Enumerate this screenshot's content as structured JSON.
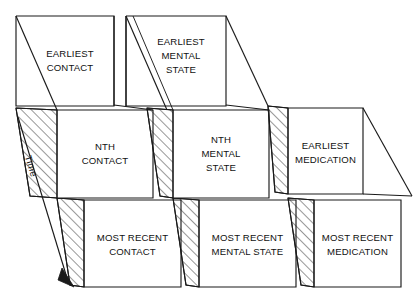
{
  "diagram": {
    "axis": {
      "label": "Time",
      "direction": "down-left",
      "arrow": "arrow-head-down-left"
    },
    "colors": {
      "stroke": "#1a1a1a",
      "fill": "#ffffff",
      "hatch": "#1a1a1a"
    },
    "columns": [
      {
        "id": "contact",
        "name": "Contact"
      },
      {
        "id": "mental-state",
        "name": "Mental State"
      },
      {
        "id": "medication",
        "name": "Medication"
      }
    ],
    "rows": [
      {
        "id": "earliest",
        "name": "Earliest"
      },
      {
        "id": "nth",
        "name": "Nth"
      },
      {
        "id": "most-recent",
        "name": "Most Recent"
      }
    ],
    "boxes": {
      "earliest_contact": {
        "line1": "EARLIEST",
        "line2": "CONTACT",
        "line3": ""
      },
      "earliest_mental_state": {
        "line1": "EARLIEST",
        "line2": "MENTAL",
        "line3": "STATE"
      },
      "nth_contact": {
        "line1": "NTH",
        "line2": "CONTACT",
        "line3": ""
      },
      "nth_mental_state": {
        "line1": "NTH",
        "line2": "MENTAL",
        "line3": "STATE"
      },
      "earliest_medication": {
        "line1": "EARLIEST",
        "line2": "MEDICATION",
        "line3": ""
      },
      "most_recent_contact": {
        "line1": "MOST RECENT",
        "line2": "CONTACT",
        "line3": ""
      },
      "most_recent_mental_state": {
        "line1": "MOST RECENT",
        "line2": "MENTAL STATE",
        "line3": ""
      },
      "most_recent_medication": {
        "line1": "MOST RECENT",
        "line2": "MEDICATION",
        "line3": ""
      }
    }
  }
}
